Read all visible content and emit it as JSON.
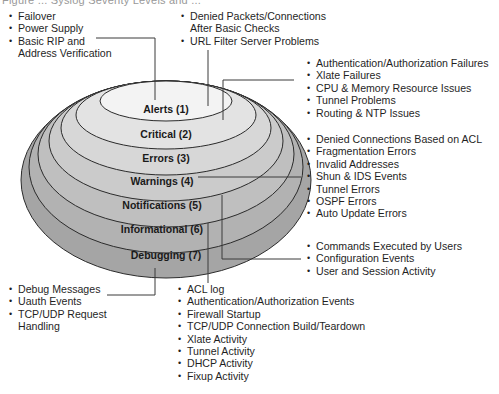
{
  "figure": {
    "caption_fragment": "Figure ... Syslog Severity Levels and ..."
  },
  "levels": [
    {
      "label": "Alerts (1)",
      "fill": "#f1f1f1"
    },
    {
      "label": "Critical (2)",
      "fill": "#e2e2e2"
    },
    {
      "label": "Errors (3)",
      "fill": "#d6d6d6"
    },
    {
      "label": "Warnings (4)",
      "fill": "#c9c9c9"
    },
    {
      "label": "Notifications (5)",
      "fill": "#bdbdbd"
    },
    {
      "label": "Informational (6)",
      "fill": "#b0b0b0"
    },
    {
      "label": "Debugging (7)",
      "fill": "#a3a3a3"
    }
  ],
  "annotations": {
    "alerts_left": [
      "Failover",
      "Power Supply",
      "Basic RIP and",
      "Address Verification"
    ],
    "alerts_top": [
      "Denied Packets/Connections",
      "After Basic Checks",
      "URL Filter Server Problems"
    ],
    "critical": [
      "Authentication/Authorization Failures",
      "Xlate Failures",
      "CPU & Memory Resource Issues",
      "Tunnel Problems",
      "Routing & NTP Issues"
    ],
    "warnings": [
      "Denied Connections Based on ACL",
      "Fragmentation Errors",
      "Invalid Addresses",
      "Shun & IDS Events",
      "Tunnel Errors",
      "OSPF Errors",
      "Auto Update Errors"
    ],
    "notifications": [
      "Commands Executed by Users",
      "Configuration Events",
      "User and Session Activity"
    ],
    "debugging": [
      "Debug Messages",
      "Uauth Events",
      "TCP/UDP Request",
      "Handling"
    ],
    "informational": [
      "ACL log",
      "Authentication/Authorization Events",
      "Firewall Startup",
      "TCP/UDP Connection Build/Teardown",
      "Xlate Activity",
      "Tunnel Activity",
      "DHCP Activity",
      "Fixup Activity"
    ]
  }
}
